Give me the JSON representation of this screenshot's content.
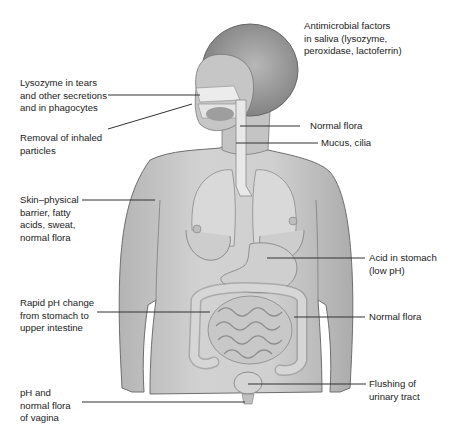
{
  "diagram": {
    "colors": {
      "skin_fill": "#c9c9c9",
      "skin_shade": "#a9a9a9",
      "hair_fill": "#9a9a9a",
      "organ_fill": "#d8d8d8",
      "outline": "#6e6e6e",
      "leader_line": "#333333",
      "text": "#222222"
    },
    "labels": {
      "saliva": "Antimicrobial factors\nin saliva (lysozyme,\nperoxidase, lactoferrin)",
      "lysozyme_tears": "Lysozyme in tears\nand other secretions\nand in phagocytes",
      "inhaled_particles": "Removal of inhaled\nparticles",
      "normal_flora_throat": "Normal flora",
      "mucus_cilia": "Mucus, cilia",
      "skin": "Skin–physical\nbarrier, fatty\nacids, sweat,\nnormal flora",
      "acid_stomach": "Acid in stomach\n(low pH)",
      "rapid_ph": "Rapid pH change\nfrom stomach to\nupper intestine",
      "normal_flora_intestine": "Normal flora",
      "urinary": "Flushing of\nurinary tract",
      "vagina": "pH and\nnormal flora\nof vagina"
    }
  }
}
